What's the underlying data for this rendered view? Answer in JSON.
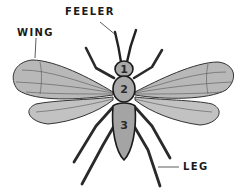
{
  "diagram": {
    "labels": {
      "feeler": "FEELER",
      "wing": "WING",
      "leg": "LEG"
    },
    "segments": [
      {
        "number": "1"
      },
      {
        "number": "2"
      },
      {
        "number": "3"
      }
    ],
    "colors": {
      "background": "#ffffff",
      "wing_fill": "#b5b5b5",
      "body_fill": "#a8a8a8",
      "outline": "#1a1a1a",
      "text": "#1a1a1a"
    }
  }
}
